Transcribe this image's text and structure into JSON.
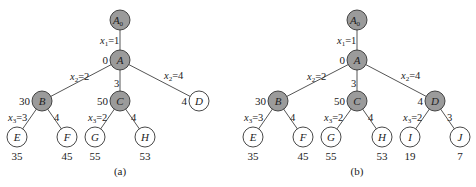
{
  "figure": {
    "background": "#ffffff",
    "colors": {
      "filled_node": "#9b9b9b",
      "empty_node": "#ffffff",
      "stroke": "#333333",
      "edge": "#555555"
    },
    "trees": [
      {
        "id": "a",
        "caption": "(a)",
        "caption_pos": [
          120,
          175
        ],
        "nodes": [
          {
            "id": "A0",
            "label": "A",
            "sub": "0",
            "x": 120,
            "y": 20,
            "filled": true
          },
          {
            "id": "A",
            "label": "A",
            "x": 120,
            "y": 60,
            "filled": true,
            "value": "0",
            "value_side": "left"
          },
          {
            "id": "B",
            "label": "B",
            "x": 42,
            "y": 101,
            "filled": true,
            "value": "30",
            "value_side": "left"
          },
          {
            "id": "C",
            "label": "C",
            "x": 120,
            "y": 101,
            "filled": true,
            "value": "50",
            "value_side": "left"
          },
          {
            "id": "D",
            "label": "D",
            "x": 199,
            "y": 101,
            "filled": false,
            "value": "4",
            "value_side": "left"
          },
          {
            "id": "E",
            "label": "E",
            "x": 17,
            "y": 137,
            "filled": false,
            "value": "35",
            "value_side": "below"
          },
          {
            "id": "F",
            "label": "F",
            "x": 67,
            "y": 137,
            "filled": false,
            "value": "45",
            "value_side": "below"
          },
          {
            "id": "G",
            "label": "G",
            "x": 95,
            "y": 137,
            "filled": false,
            "value": "55",
            "value_side": "below"
          },
          {
            "id": "H",
            "label": "H",
            "x": 145,
            "y": 137,
            "filled": false,
            "value": "53",
            "value_side": "below"
          }
        ],
        "edges": [
          {
            "from": "A0",
            "to": "A",
            "var": "x",
            "sub": "1",
            "text": "=1",
            "lx": 100,
            "ly": 44
          },
          {
            "from": "A",
            "to": "B",
            "var": "x",
            "sub": "2",
            "text": "=2",
            "lx": 70,
            "ly": 80
          },
          {
            "from": "A",
            "to": "C",
            "var": "",
            "sub": "",
            "text": "3",
            "lx": 114,
            "ly": 87
          },
          {
            "from": "A",
            "to": "D",
            "var": "x",
            "sub": "2",
            "text": "=4",
            "lx": 164,
            "ly": 79
          },
          {
            "from": "B",
            "to": "E",
            "var": "x",
            "sub": "3",
            "text": "=3",
            "lx": 8,
            "ly": 121
          },
          {
            "from": "B",
            "to": "F",
            "var": "",
            "sub": "",
            "text": "4",
            "lx": 54,
            "ly": 121
          },
          {
            "from": "C",
            "to": "G",
            "var": "x",
            "sub": "3",
            "text": "=2",
            "lx": 88,
            "ly": 121
          },
          {
            "from": "C",
            "to": "H",
            "var": "",
            "sub": "",
            "text": "4",
            "lx": 131,
            "ly": 121
          }
        ]
      },
      {
        "id": "b",
        "caption": "(b)",
        "caption_pos": [
          357,
          175
        ],
        "nodes": [
          {
            "id": "A0",
            "label": "A",
            "sub": "0",
            "x": 357,
            "y": 20,
            "filled": true
          },
          {
            "id": "A",
            "label": "A",
            "x": 357,
            "y": 60,
            "filled": true,
            "value": "0",
            "value_side": "left"
          },
          {
            "id": "B",
            "label": "B",
            "x": 278,
            "y": 101,
            "filled": true,
            "value": "30",
            "value_side": "left"
          },
          {
            "id": "C",
            "label": "C",
            "x": 357,
            "y": 101,
            "filled": true,
            "value": "50",
            "value_side": "left"
          },
          {
            "id": "D",
            "label": "D",
            "x": 435,
            "y": 101,
            "filled": true,
            "value": "4",
            "value_side": "left"
          },
          {
            "id": "E",
            "label": "E",
            "x": 253,
            "y": 137,
            "filled": false,
            "value": "35",
            "value_side": "below"
          },
          {
            "id": "F",
            "label": "F",
            "x": 303,
            "y": 137,
            "filled": false,
            "value": "45",
            "value_side": "below"
          },
          {
            "id": "G",
            "label": "G",
            "x": 331,
            "y": 137,
            "filled": false,
            "value": "55",
            "value_side": "below"
          },
          {
            "id": "H",
            "label": "H",
            "x": 382,
            "y": 137,
            "filled": false,
            "value": "53",
            "value_side": "below"
          },
          {
            "id": "I",
            "label": "I",
            "x": 410,
            "y": 137,
            "filled": false,
            "value": "19",
            "value_side": "below"
          },
          {
            "id": "J",
            "label": "J",
            "x": 460,
            "y": 137,
            "filled": false,
            "value": "7",
            "value_side": "below"
          }
        ],
        "edges": [
          {
            "from": "A0",
            "to": "A",
            "var": "x",
            "sub": "1",
            "text": "=1",
            "lx": 337,
            "ly": 44
          },
          {
            "from": "A",
            "to": "B",
            "var": "x",
            "sub": "2",
            "text": "=2",
            "lx": 307,
            "ly": 80
          },
          {
            "from": "A",
            "to": "C",
            "var": "",
            "sub": "",
            "text": "3",
            "lx": 351,
            "ly": 87
          },
          {
            "from": "A",
            "to": "D",
            "var": "x",
            "sub": "2",
            "text": "=4",
            "lx": 401,
            "ly": 79
          },
          {
            "from": "B",
            "to": "E",
            "var": "x",
            "sub": "3",
            "text": "=3",
            "lx": 244,
            "ly": 121
          },
          {
            "from": "B",
            "to": "F",
            "var": "",
            "sub": "",
            "text": "4",
            "lx": 290,
            "ly": 121
          },
          {
            "from": "C",
            "to": "G",
            "var": "x",
            "sub": "3",
            "text": "=2",
            "lx": 324,
            "ly": 121
          },
          {
            "from": "C",
            "to": "H",
            "var": "",
            "sub": "",
            "text": "4",
            "lx": 368,
            "ly": 121
          },
          {
            "from": "D",
            "to": "I",
            "var": "x",
            "sub": "3",
            "text": "=2",
            "lx": 403,
            "ly": 121
          },
          {
            "from": "D",
            "to": "J",
            "var": "",
            "sub": "",
            "text": "3",
            "lx": 447,
            "ly": 121
          }
        ]
      }
    ]
  }
}
